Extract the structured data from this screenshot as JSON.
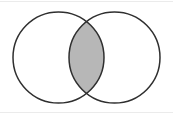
{
  "diagram": {
    "type": "venn",
    "canvas": {
      "width": 173,
      "height": 115,
      "background": "#ffffff"
    },
    "circles": [
      {
        "id": "left",
        "cx": 58.5,
        "cy": 57.5,
        "r": 45.5
      },
      {
        "id": "right",
        "cx": 114.5,
        "cy": 57.5,
        "r": 45.5
      }
    ],
    "style": {
      "stroke_color": "#2f2f2f",
      "stroke_width": 1.5,
      "circle_fill": "none",
      "intersection_fill": "#b7b7b7",
      "edge_artifact_color": "#ebebeb"
    }
  }
}
